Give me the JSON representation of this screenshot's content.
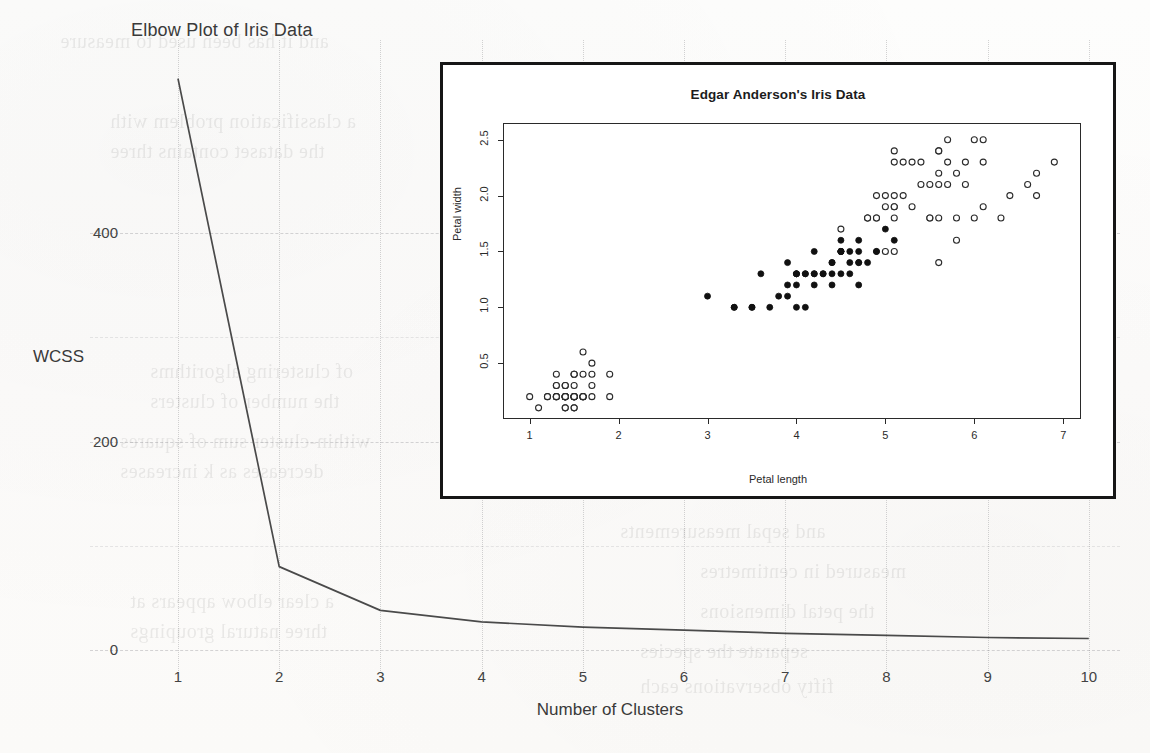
{
  "page": {
    "background_color": "#fdfdfc",
    "ink_color": "#3a3a3a"
  },
  "outer_plot": {
    "title": "Elbow Plot of Iris Data",
    "ylabel": "WCSS",
    "xlabel": "Number of Clusters",
    "yticks": [
      "400",
      "200",
      "0"
    ],
    "xticks": [
      "1",
      "2",
      "3",
      "4",
      "5",
      "6",
      "7",
      "8",
      "9",
      "10"
    ]
  },
  "inset_plot": {
    "title": "Edgar Anderson's Iris Data",
    "xlabel": "Petal length",
    "ylabel": "Petal width",
    "xticks": [
      "1",
      "2",
      "3",
      "4",
      "5",
      "6",
      "7"
    ],
    "yticks": [
      "0.5",
      "1.0",
      "1.5",
      "2.0",
      "2.5"
    ]
  },
  "ghost_text": [
    {
      "text": "and it has been used to measure",
      "left": 60,
      "top": 30
    },
    {
      "text": "a classification problem with",
      "left": 110,
      "top": 110
    },
    {
      "text": "the dataset contains three",
      "left": 110,
      "top": 140
    },
    {
      "text": "of clustering algorithms",
      "left": 150,
      "top": 360
    },
    {
      "text": "the number of clusters",
      "left": 150,
      "top": 390
    },
    {
      "text": "within-cluster sum of squares",
      "left": 120,
      "top": 430
    },
    {
      "text": "decreases as k increases",
      "left": 120,
      "top": 460
    },
    {
      "text": "a clear elbow appears at",
      "left": 130,
      "top": 590
    },
    {
      "text": "three natural groupings",
      "left": 130,
      "top": 620
    },
    {
      "text": "measured in centimetres",
      "left": 700,
      "top": 560
    },
    {
      "text": "the petal dimensions",
      "left": 700,
      "top": 600
    },
    {
      "text": "separate the species",
      "left": 640,
      "top": 640
    },
    {
      "text": "fifty observations each",
      "left": 640,
      "top": 675
    },
    {
      "text": "and sepal measurements",
      "left": 620,
      "top": 520
    },
    {
      "text": "results of the analysis",
      "left": 660,
      "top": 300
    },
    {
      "text": "an unsupervised method",
      "left": 680,
      "top": 250
    }
  ],
  "chart_data": [
    {
      "type": "line",
      "title": "Elbow Plot of Iris Data",
      "xlabel": "Number of Clusters",
      "ylabel": "WCSS",
      "xlim": [
        0.6,
        10.4
      ],
      "ylim": [
        0,
        560
      ],
      "xticks": [
        1,
        2,
        3,
        4,
        5,
        6,
        7,
        8,
        9,
        10
      ],
      "yticks": [
        0,
        200,
        400
      ],
      "grid": true,
      "legend": "none",
      "x": [
        1,
        2,
        3,
        4,
        5,
        6,
        7,
        8,
        9,
        10
      ],
      "values": [
        548,
        80,
        38,
        27,
        22,
        19,
        16,
        14,
        12,
        11
      ]
    },
    {
      "type": "scatter",
      "title": "Edgar Anderson's Iris Data",
      "xlabel": "Petal length",
      "ylabel": "Petal width",
      "xlim": [
        0.7,
        7.2
      ],
      "ylim": [
        0.0,
        2.65
      ],
      "xticks": [
        1,
        2,
        3,
        4,
        5,
        6,
        7
      ],
      "yticks": [
        0.5,
        1.0,
        1.5,
        2.0,
        2.5
      ],
      "grid": false,
      "legend": "none",
      "series": [
        {
          "name": "setosa",
          "marker": "open-circle",
          "points": [
            [
              1.4,
              0.2
            ],
            [
              1.4,
              0.2
            ],
            [
              1.3,
              0.2
            ],
            [
              1.5,
              0.2
            ],
            [
              1.4,
              0.2
            ],
            [
              1.7,
              0.4
            ],
            [
              1.4,
              0.3
            ],
            [
              1.5,
              0.2
            ],
            [
              1.4,
              0.2
            ],
            [
              1.5,
              0.1
            ],
            [
              1.5,
              0.2
            ],
            [
              1.6,
              0.2
            ],
            [
              1.4,
              0.1
            ],
            [
              1.1,
              0.1
            ],
            [
              1.2,
              0.2
            ],
            [
              1.5,
              0.4
            ],
            [
              1.3,
              0.4
            ],
            [
              1.4,
              0.3
            ],
            [
              1.7,
              0.3
            ],
            [
              1.5,
              0.3
            ],
            [
              1.7,
              0.2
            ],
            [
              1.5,
              0.4
            ],
            [
              1.0,
              0.2
            ],
            [
              1.7,
              0.5
            ],
            [
              1.9,
              0.2
            ],
            [
              1.6,
              0.2
            ],
            [
              1.6,
              0.4
            ],
            [
              1.5,
              0.2
            ],
            [
              1.4,
              0.2
            ],
            [
              1.6,
              0.2
            ],
            [
              1.6,
              0.2
            ],
            [
              1.5,
              0.4
            ],
            [
              1.5,
              0.1
            ],
            [
              1.4,
              0.2
            ],
            [
              1.5,
              0.2
            ],
            [
              1.2,
              0.2
            ],
            [
              1.3,
              0.2
            ],
            [
              1.4,
              0.1
            ],
            [
              1.3,
              0.2
            ],
            [
              1.5,
              0.2
            ],
            [
              1.3,
              0.3
            ],
            [
              1.3,
              0.3
            ],
            [
              1.3,
              0.2
            ],
            [
              1.6,
              0.6
            ],
            [
              1.9,
              0.4
            ],
            [
              1.4,
              0.3
            ],
            [
              1.6,
              0.2
            ],
            [
              1.4,
              0.2
            ],
            [
              1.5,
              0.2
            ],
            [
              1.4,
              0.2
            ]
          ]
        },
        {
          "name": "versicolor",
          "marker": "filled-circle",
          "points": [
            [
              4.7,
              1.4
            ],
            [
              4.5,
              1.5
            ],
            [
              4.9,
              1.5
            ],
            [
              4.0,
              1.3
            ],
            [
              4.6,
              1.5
            ],
            [
              4.5,
              1.3
            ],
            [
              4.7,
              1.6
            ],
            [
              3.3,
              1.0
            ],
            [
              4.6,
              1.3
            ],
            [
              3.9,
              1.4
            ],
            [
              3.5,
              1.0
            ],
            [
              4.2,
              1.5
            ],
            [
              4.0,
              1.0
            ],
            [
              4.7,
              1.4
            ],
            [
              3.6,
              1.3
            ],
            [
              4.4,
              1.4
            ],
            [
              4.5,
              1.5
            ],
            [
              4.1,
              1.0
            ],
            [
              4.5,
              1.5
            ],
            [
              3.9,
              1.1
            ],
            [
              4.8,
              1.8
            ],
            [
              4.0,
              1.3
            ],
            [
              4.9,
              1.5
            ],
            [
              4.7,
              1.2
            ],
            [
              4.3,
              1.3
            ],
            [
              4.4,
              1.4
            ],
            [
              4.8,
              1.4
            ],
            [
              5.0,
              1.7
            ],
            [
              4.5,
              1.5
            ],
            [
              3.5,
              1.0
            ],
            [
              3.8,
              1.1
            ],
            [
              3.7,
              1.0
            ],
            [
              3.9,
              1.2
            ],
            [
              5.1,
              1.6
            ],
            [
              4.5,
              1.5
            ],
            [
              4.5,
              1.6
            ],
            [
              4.7,
              1.5
            ],
            [
              4.4,
              1.3
            ],
            [
              4.1,
              1.3
            ],
            [
              4.0,
              1.3
            ],
            [
              4.4,
              1.2
            ],
            [
              4.6,
              1.4
            ],
            [
              4.0,
              1.2
            ],
            [
              3.3,
              1.0
            ],
            [
              4.2,
              1.3
            ],
            [
              4.2,
              1.2
            ],
            [
              4.2,
              1.3
            ],
            [
              4.3,
              1.3
            ],
            [
              3.0,
              1.1
            ],
            [
              4.1,
              1.3
            ]
          ]
        },
        {
          "name": "virginica",
          "marker": "open-circle",
          "points": [
            [
              6.0,
              2.5
            ],
            [
              5.1,
              1.9
            ],
            [
              5.9,
              2.1
            ],
            [
              5.6,
              1.8
            ],
            [
              5.8,
              2.2
            ],
            [
              6.6,
              2.1
            ],
            [
              4.5,
              1.7
            ],
            [
              6.3,
              1.8
            ],
            [
              5.8,
              1.8
            ],
            [
              6.1,
              2.5
            ],
            [
              5.1,
              2.0
            ],
            [
              5.3,
              1.9
            ],
            [
              5.5,
              2.1
            ],
            [
              5.0,
              2.0
            ],
            [
              5.1,
              2.4
            ],
            [
              5.3,
              2.3
            ],
            [
              5.5,
              1.8
            ],
            [
              6.7,
              2.2
            ],
            [
              6.9,
              2.3
            ],
            [
              5.0,
              1.5
            ],
            [
              5.7,
              2.3
            ],
            [
              4.9,
              2.0
            ],
            [
              6.7,
              2.0
            ],
            [
              4.9,
              1.8
            ],
            [
              5.7,
              2.1
            ],
            [
              6.0,
              1.8
            ],
            [
              4.8,
              1.8
            ],
            [
              4.9,
              1.8
            ],
            [
              5.6,
              2.1
            ],
            [
              5.8,
              1.6
            ],
            [
              6.1,
              1.9
            ],
            [
              6.4,
              2.0
            ],
            [
              5.6,
              2.2
            ],
            [
              5.1,
              1.5
            ],
            [
              5.6,
              1.4
            ],
            [
              6.1,
              2.3
            ],
            [
              5.6,
              2.4
            ],
            [
              5.5,
              1.8
            ],
            [
              4.8,
              1.8
            ],
            [
              5.4,
              2.1
            ],
            [
              5.6,
              2.4
            ],
            [
              5.1,
              2.3
            ],
            [
              5.1,
              1.9
            ],
            [
              5.9,
              2.3
            ],
            [
              5.7,
              2.5
            ],
            [
              5.2,
              2.3
            ],
            [
              5.0,
              1.9
            ],
            [
              5.2,
              2.0
            ],
            [
              5.4,
              2.3
            ],
            [
              5.1,
              1.8
            ]
          ]
        }
      ]
    }
  ]
}
